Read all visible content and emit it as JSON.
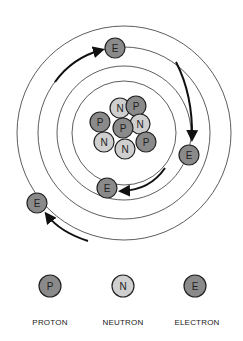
{
  "diagram": {
    "title": "",
    "type": "atom",
    "colors": {
      "proton": "#8a8a8a",
      "neutron": "#cfcfcf",
      "electron": "#8a8a8a",
      "stroke": "#222222",
      "ring": "#333333",
      "background": "#ffffff"
    },
    "nucleus": [
      {
        "symbol": "N",
        "kind": "neutron",
        "x": 120,
        "y": 108
      },
      {
        "symbol": "P",
        "kind": "proton",
        "x": 136,
        "y": 106
      },
      {
        "symbol": "P",
        "kind": "proton",
        "x": 100,
        "y": 122
      },
      {
        "symbol": "N",
        "kind": "neutron",
        "x": 140,
        "y": 124
      },
      {
        "symbol": "P",
        "kind": "proton",
        "x": 123,
        "y": 128
      },
      {
        "symbol": "N",
        "kind": "neutron",
        "x": 104,
        "y": 142
      },
      {
        "symbol": "P",
        "kind": "proton",
        "x": 146,
        "y": 142
      },
      {
        "symbol": "N",
        "kind": "neutron",
        "x": 125,
        "y": 149
      }
    ],
    "electrons": [
      {
        "symbol": "E",
        "x": 115,
        "y": 48
      },
      {
        "symbol": "E",
        "x": 189,
        "y": 155
      },
      {
        "symbol": "E",
        "x": 107,
        "y": 188
      },
      {
        "symbol": "E",
        "x": 37,
        "y": 203
      }
    ],
    "legend": [
      {
        "symbol": "P",
        "kind": "proton",
        "label": "PROTON"
      },
      {
        "symbol": "N",
        "kind": "neutron",
        "label": "NEUTRON"
      },
      {
        "symbol": "E",
        "kind": "electron",
        "label": "ELECTRON"
      }
    ]
  }
}
